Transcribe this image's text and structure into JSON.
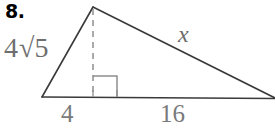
{
  "figure": {
    "problem_number": "8.",
    "shape": "triangle",
    "labels": {
      "leg_left": "4√5",
      "leg_left_coefficient": "4",
      "leg_left_radicand": "5",
      "hypotenuse": "x",
      "base_segment_left": "4",
      "base_segment_right": "16"
    },
    "colors": {
      "background": "#ffffff",
      "stroke": "#3a3a3a",
      "dashed_stroke": "#8c8c8c",
      "right_angle_stroke": "#8c8c8c",
      "number_text": "#000000",
      "label_text": "#6e6e6e"
    },
    "geometry": {
      "apex": [
        93,
        7
      ],
      "left_vertex": [
        42,
        97
      ],
      "right_vertex": [
        274,
        98
      ],
      "foot_of_altitude": [
        93,
        97
      ],
      "right_angle_box": [
        93,
        76,
        117,
        97
      ],
      "tick_left": 93,
      "tick_right": 117
    }
  }
}
